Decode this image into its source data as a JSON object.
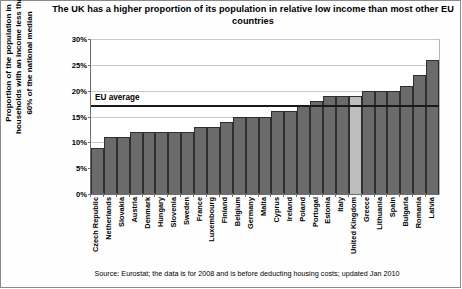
{
  "chart": {
    "title": "The UK has a higher proportion of its population in relative low income than most other EU countries",
    "title_line1": "The UK has a higher proportion of its population in relative low income",
    "title_line2": "than most other EU countries",
    "ylabel": "Proportion of the population in households with an income less than 60% of the national median",
    "ylabel_line1": "Proportion of the population in",
    "ylabel_line2": "households with an income less than",
    "ylabel_line3": "60% of the national median",
    "source": "Source: Eurostat; the data is for 2008 and is before deducting housing costs; updated Jan 2010",
    "eu_average_label": "EU average"
  },
  "chart_data": {
    "type": "bar",
    "title": "The UK has a higher proportion of its population in relative low income than most other EU countries",
    "xlabel": "",
    "ylabel": "Proportion of the population in households with an income less than 60% of the national median",
    "ylim": [
      0,
      30
    ],
    "ytick_values": [
      0,
      5,
      10,
      15,
      20,
      25,
      30
    ],
    "ytick_labels": [
      "0%",
      "5%",
      "10%",
      "15%",
      "20%",
      "25%",
      "30%"
    ],
    "grid": true,
    "legend": "none",
    "highlight_category": "United Kingdom",
    "highlight_color": "#bdbdbd",
    "bar_color": "#6b6b6b",
    "annotations": [
      {
        "type": "hline",
        "label": "EU average",
        "value": 17
      }
    ],
    "categories": [
      "Czech Republic",
      "Netherlands",
      "Slovakia",
      "Austria",
      "Denmark",
      "Hungary",
      "Slovenia",
      "Sweden",
      "France",
      "Luxembourg",
      "Finland",
      "Belgium",
      "Germany",
      "Malta",
      "Cyprus",
      "Ireland",
      "Poland",
      "Portugal",
      "Estonia",
      "Italy",
      "United Kingdom",
      "Greece",
      "Lithuania",
      "Spain",
      "Bulgaria",
      "Romania",
      "Latvia"
    ],
    "values": [
      9,
      11,
      11,
      12,
      12,
      12,
      12,
      12,
      13,
      13,
      14,
      15,
      15,
      15,
      16,
      16,
      17,
      18,
      19,
      19,
      19,
      20,
      20,
      20,
      21,
      23,
      26
    ]
  }
}
